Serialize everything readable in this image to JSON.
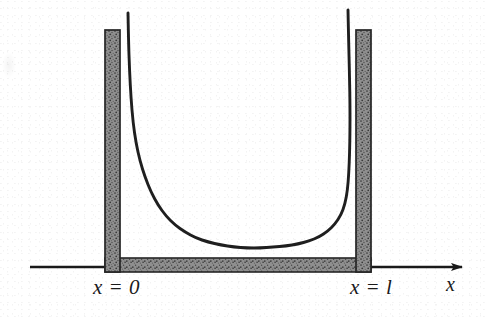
{
  "figure": {
    "kind": "physics-potential-diagram",
    "background_color": "#ffffff",
    "ink_color": "#1a1a1a",
    "wall_fill_color": "#8c8c8c",
    "wall_border_color": "#2b2b2b",
    "curve_color": "#1f1f1f"
  },
  "labels": {
    "left_boundary": "x = 0",
    "right_boundary": "x = l",
    "axis_x": "x"
  },
  "axis": {
    "orientation": "horizontal",
    "has_arrowhead": true,
    "arrow_direction": "right",
    "x_start_px": 30,
    "x_end_px": 466,
    "y_px": 267
  },
  "walls": {
    "description": "Stippled gray barrier forming a U-shaped box: two vertical walls plus a floor strip",
    "left_wall": {
      "x_px": 105,
      "width_px": 15,
      "top_px": 30,
      "bottom_px": 272
    },
    "right_wall": {
      "x_px": 356,
      "width_px": 15,
      "top_px": 30,
      "bottom_px": 272
    },
    "floor": {
      "x_px": 105,
      "width_px": 266,
      "top_px": 258,
      "height_px": 14
    }
  },
  "chart_data": {
    "type": "line",
    "xlabel": "x",
    "ylabel": "",
    "grid": false,
    "legend": null,
    "annotations": [
      {
        "text": "x = 0",
        "x_px": 93,
        "y_px": 277
      },
      {
        "text": "x = l",
        "x_px": 350,
        "y_px": 277
      },
      {
        "text": "x",
        "x_px": 446,
        "y_px": 274
      }
    ],
    "series": [
      {
        "name": "potential V(x)",
        "comment": "U-shaped curve diverging at both walls, flat minimum in the middle",
        "points_px": [
          [
            128,
            13
          ],
          [
            128.5,
            40
          ],
          [
            129.5,
            70
          ],
          [
            131,
            98
          ],
          [
            133,
            122
          ],
          [
            136,
            143
          ],
          [
            140,
            161
          ],
          [
            145,
            177
          ],
          [
            151,
            192
          ],
          [
            158,
            205
          ],
          [
            166,
            216
          ],
          [
            175,
            225
          ],
          [
            185,
            232
          ],
          [
            196,
            238
          ],
          [
            208,
            242
          ],
          [
            221,
            245
          ],
          [
            234,
            247
          ],
          [
            247,
            248
          ],
          [
            260,
            248
          ],
          [
            273,
            247
          ],
          [
            286,
            246
          ],
          [
            298,
            244
          ],
          [
            309,
            241
          ],
          [
            319,
            237
          ],
          [
            328,
            231
          ],
          [
            335,
            224
          ],
          [
            341,
            215
          ],
          [
            345,
            204
          ],
          [
            347.5,
            190
          ],
          [
            348.8,
            173
          ],
          [
            349.6,
            153
          ],
          [
            350,
            130
          ],
          [
            350,
            105
          ],
          [
            349.6,
            80
          ],
          [
            349,
            55
          ],
          [
            348.4,
            30
          ],
          [
            348,
            10
          ]
        ]
      }
    ]
  }
}
